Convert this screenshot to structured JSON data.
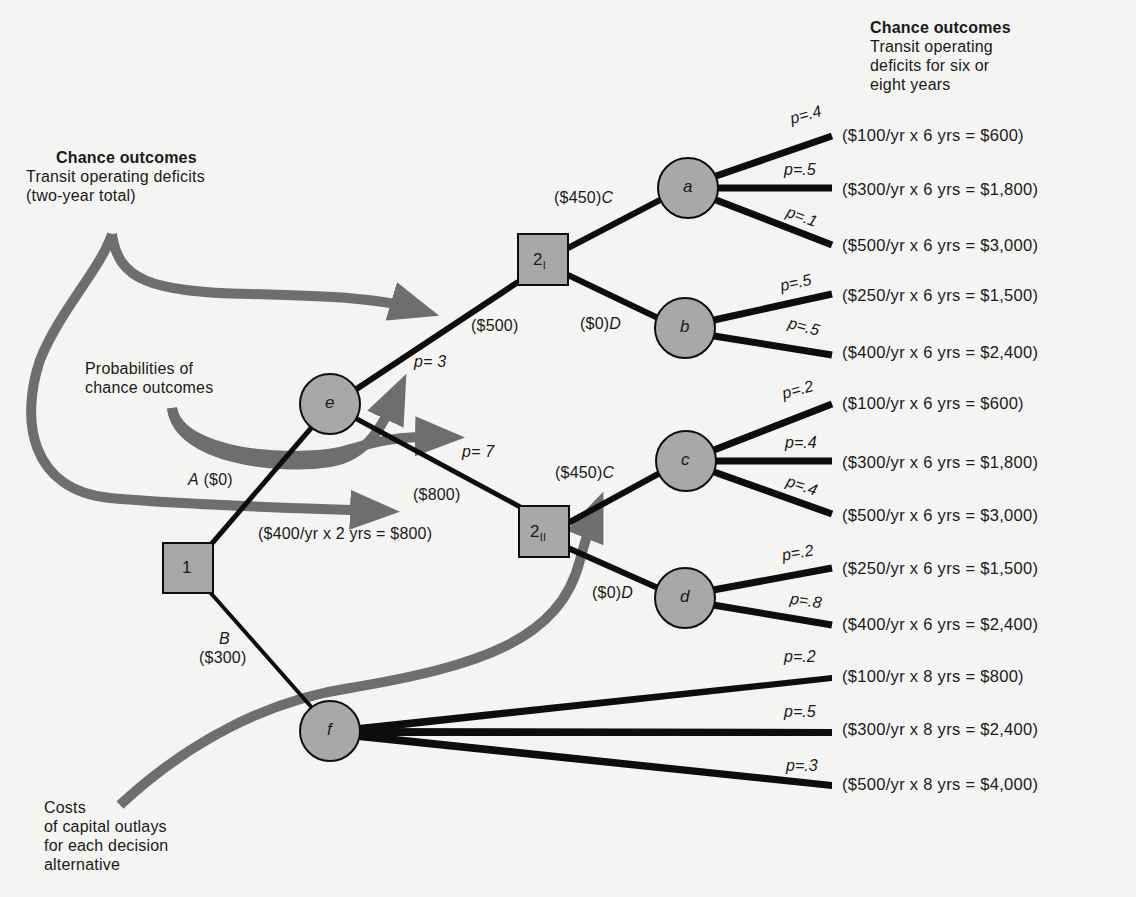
{
  "annotations": {
    "top_right": {
      "title": "Chance outcomes",
      "lines": [
        "Transit operating",
        "deficits for six or",
        "eight years"
      ]
    },
    "top_left": {
      "title": "Chance outcomes",
      "lines": [
        "Transit operating deficits",
        "(two-year total)"
      ]
    },
    "probabilities": {
      "lines": [
        "Probabilities of",
        "chance outcomes"
      ]
    },
    "costs": {
      "lines": [
        "Costs",
        "of capital outlays",
        "for each decision",
        "alternative"
      ]
    }
  },
  "nodes": {
    "decision_1": {
      "label": "1",
      "type": "decision"
    },
    "decision_2I": {
      "label": "2",
      "sub": "I",
      "type": "decision"
    },
    "decision_2II": {
      "label": "2",
      "sub": "II",
      "type": "decision"
    },
    "chance_e": {
      "label": "e",
      "type": "chance"
    },
    "chance_f": {
      "label": "f",
      "type": "chance"
    },
    "chance_a": {
      "label": "a",
      "type": "chance"
    },
    "chance_b": {
      "label": "b",
      "type": "chance"
    },
    "chance_c": {
      "label": "c",
      "type": "chance"
    },
    "chance_d": {
      "label": "d",
      "type": "chance"
    }
  },
  "branches": {
    "A": {
      "letter": "A",
      "cost": "($0)"
    },
    "B": {
      "letter": "B",
      "cost": "($300)"
    },
    "e_up": {
      "prob": "p= 3",
      "cost": "($500)"
    },
    "e_down": {
      "prob": "p= 7",
      "cost": "($800)",
      "detail": "($400/yr  x  2  yrs  =  $800)"
    },
    "2I_C": {
      "cost": "($450)",
      "letter": "C"
    },
    "2I_D": {
      "cost": "($0)",
      "letter": "D"
    },
    "2II_C": {
      "cost": "($450)",
      "letter": "C"
    },
    "2II_D": {
      "cost": "($0)",
      "letter": "D"
    }
  },
  "outcomes": [
    {
      "node": "a",
      "prob": "p=.4",
      "text": "($100/yr  x  6  yrs  =  $600)"
    },
    {
      "node": "a",
      "prob": "p=.5",
      "text": "($300/yr  x  6  yrs  =  $1,800)"
    },
    {
      "node": "a",
      "prob": "p=.1",
      "text": "($500/yr  x  6  yrs  =  $3,000)"
    },
    {
      "node": "b",
      "prob": "p=.5",
      "text": "($250/yr  x  6  yrs  =  $1,500)"
    },
    {
      "node": "b",
      "prob": "p=.5",
      "text": "($400/yr  x  6  yrs  =  $2,400)"
    },
    {
      "node": "c",
      "prob": "p=.2",
      "text": "($100/yr  x  6  yrs  =  $600)"
    },
    {
      "node": "c",
      "prob": "p=.4",
      "text": "($300/yr  x  6  yrs  =  $1,800)"
    },
    {
      "node": "c",
      "prob": "p=.4",
      "text": "($500/yr  x  6  yrs  =  $3,000)"
    },
    {
      "node": "d",
      "prob": "p=.2",
      "text": "($250/yr  x  6  yrs  =  $1,500)"
    },
    {
      "node": "d",
      "prob": "p=.8",
      "text": "($400/yr  x  6  yrs  =  $2,400)"
    },
    {
      "node": "f",
      "prob": "p=.2",
      "text": "($100/yr  x  8  yrs  =  $800)"
    },
    {
      "node": "f",
      "prob": "p=.5",
      "text": "($300/yr  x  8  yrs  =  $2,400)"
    },
    {
      "node": "f",
      "prob": "p=.3",
      "text": "($500/yr  x  8  yrs  =  $4,000)"
    }
  ],
  "colors": {
    "background": "#f4f4f2",
    "node_fill": "#a8a8a8",
    "line": "#0d0d0d",
    "arrow": "#6e6e6e"
  }
}
